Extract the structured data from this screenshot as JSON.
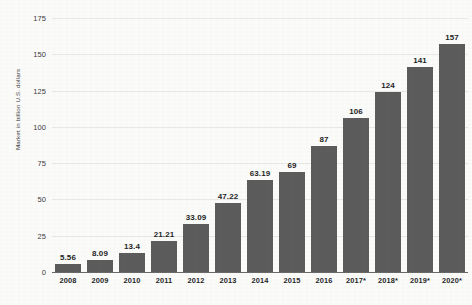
{
  "chart_data": {
    "type": "bar",
    "title": "",
    "xlabel": "",
    "ylabel": "Market in billion U.S. dollars",
    "categories": [
      "2008",
      "2009",
      "2010",
      "2011",
      "2012",
      "2013",
      "2014",
      "2015",
      "2016",
      "2017*",
      "2018*",
      "2019*",
      "2020*"
    ],
    "values": [
      5.56,
      8.09,
      13.4,
      21.21,
      33.09,
      47.22,
      63.19,
      69,
      87,
      106,
      124,
      141,
      157
    ],
    "value_labels": [
      "5.56",
      "8.09",
      "13.4",
      "21.21",
      "33.09",
      "47.22",
      "63.19",
      "69",
      "87",
      "106",
      "124",
      "141",
      "157"
    ],
    "ylim": [
      0,
      175
    ],
    "yticks": [
      0,
      25,
      50,
      75,
      100,
      125,
      150,
      175
    ],
    "ytick_labels": [
      "0",
      "25",
      "50",
      "75",
      "100",
      "125",
      "150",
      "175"
    ],
    "grid": true,
    "legend": "none",
    "series": [
      {
        "name": "Market in billion U.S. dollars",
        "values": [
          5.56,
          8.09,
          13.4,
          21.21,
          33.09,
          47.22,
          63.19,
          69,
          87,
          106,
          124,
          141,
          157
        ]
      }
    ],
    "colors": {
      "bar": "#5c5c5c",
      "background": "#fbfbfa",
      "gridline": "#e8e8e6",
      "axis": "#6a6a6a",
      "text": "#262626"
    }
  }
}
